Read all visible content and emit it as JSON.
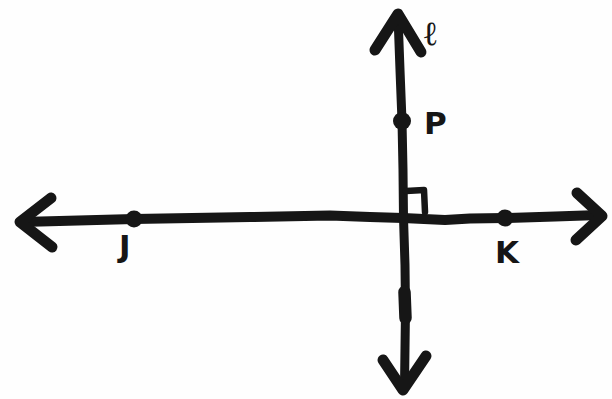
{
  "figure": {
    "background": "#fefefe",
    "ink": "#161616",
    "labels": {
      "line_l": "ℓ",
      "point_p": "P",
      "point_j": "J",
      "point_k": "K"
    },
    "geometry": {
      "type": "perpendicular-lines-diagram",
      "lines": [
        {
          "id": "l",
          "label": "ℓ",
          "orientation": "vertical",
          "arrows": "both-ends",
          "points_on_line": [
            "P"
          ]
        },
        {
          "id": "JK",
          "label": "",
          "orientation": "horizontal",
          "arrows": "both-ends",
          "points_on_line": [
            "J",
            "K"
          ]
        }
      ],
      "intersection": "lines cross at a right angle",
      "right_angle_marker": true
    }
  }
}
